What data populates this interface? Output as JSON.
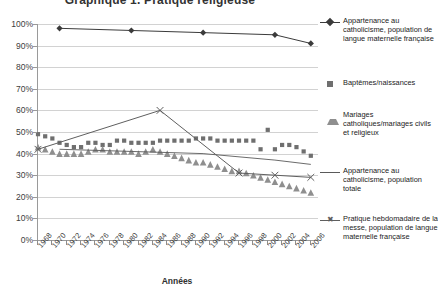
{
  "chart_data": {
    "type": "line",
    "title": "Graphique 1. Pratique religieuse",
    "xlabel": "Années",
    "ylabel": "",
    "ylim": [
      0,
      100
    ],
    "ytick_labels": [
      "100%",
      "90%",
      "80%",
      "70%",
      "60%",
      "50%",
      "40%",
      "30%",
      "20%",
      "10%",
      "0%"
    ],
    "ytick_values": [
      100,
      90,
      80,
      70,
      60,
      50,
      40,
      30,
      20,
      10,
      0
    ],
    "xlim": [
      1968,
      2007
    ],
    "xtick_labels": [
      "1968",
      "1970",
      "1972",
      "1974",
      "1976",
      "1978",
      "1980",
      "1982",
      "1984",
      "1986",
      "1988",
      "1990",
      "1992",
      "1994",
      "1996",
      "1998",
      "2000",
      "2002",
      "2004",
      "2006"
    ],
    "xtick_values": [
      1968,
      1970,
      1972,
      1974,
      1976,
      1978,
      1980,
      1982,
      1984,
      1986,
      1988,
      1990,
      1992,
      1994,
      1996,
      1998,
      2000,
      2002,
      2004,
      2006
    ],
    "grid": true,
    "legend_position": "right",
    "series": [
      {
        "name": "Appartenance au catholicisme, population de langue maternelle française",
        "marker": "diamond",
        "color": "#3b3b3b",
        "x": [
          1971,
          1981,
          1991,
          2001,
          2006
        ],
        "values": [
          98,
          97,
          96,
          95,
          91
        ]
      },
      {
        "name": "Baptêmes/naissances",
        "marker": "square",
        "color": "#6f6f6f",
        "x": [
          1968,
          1969,
          1970,
          1971,
          1972,
          1973,
          1974,
          1975,
          1976,
          1977,
          1978,
          1979,
          1980,
          1981,
          1982,
          1983,
          1984,
          1985,
          1986,
          1987,
          1988,
          1989,
          1990,
          1991,
          1992,
          1993,
          1994,
          1995,
          1996,
          1997,
          1998,
          1999,
          2000,
          2001,
          2002,
          2003,
          2004,
          2005,
          2006
        ],
        "values": [
          49,
          48,
          47,
          45,
          44,
          43,
          43,
          45,
          45,
          44,
          44,
          46,
          46,
          45,
          45,
          45,
          45,
          46,
          46,
          46,
          46,
          46,
          47,
          47,
          47,
          46,
          46,
          46,
          46,
          46,
          46,
          42,
          51,
          42,
          44,
          44,
          43,
          41,
          39
        ]
      },
      {
        "name": "Mariages catholiques/mariages civils et religieux",
        "marker": "triangle",
        "color": "#8f8f8f",
        "x": [
          1968,
          1969,
          1970,
          1971,
          1972,
          1973,
          1974,
          1975,
          1976,
          1977,
          1978,
          1979,
          1980,
          1981,
          1982,
          1983,
          1984,
          1985,
          1986,
          1987,
          1988,
          1989,
          1990,
          1991,
          1992,
          1993,
          1994,
          1995,
          1996,
          1997,
          1998,
          1999,
          2000,
          2001,
          2002,
          2003,
          2004,
          2005,
          2006
        ],
        "values": [
          43,
          42,
          41,
          40,
          40,
          40,
          40,
          41,
          42,
          42,
          41,
          41,
          41,
          41,
          40,
          41,
          42,
          41,
          40,
          39,
          38,
          37,
          36,
          36,
          35,
          34,
          33,
          32,
          32,
          31,
          30,
          29,
          28,
          27,
          26,
          25,
          24,
          23,
          22
        ]
      },
      {
        "name": "Appartenance au catholicisme, population totale",
        "marker": "line",
        "color": "#5a5a5a",
        "x": [
          1971,
          1981,
          1991,
          2001,
          2006
        ],
        "values": [
          42,
          41,
          40,
          37,
          35
        ]
      },
      {
        "name": "Pratique hebdomadaire de la messe, population de langue maternelle française",
        "marker": "x",
        "color": "#5f5f5f",
        "x": [
          1968,
          1985,
          1996,
          2001,
          2006
        ],
        "values": [
          42,
          60,
          31,
          30,
          29
        ]
      }
    ]
  }
}
